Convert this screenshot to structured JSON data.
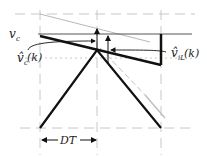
{
  "diagram": {
    "labels": {
      "vc": "v",
      "vc_sub": "c",
      "vc_hat": "v̂",
      "vc_hat_sub": "c",
      "vc_hat_arg": "(k)",
      "vil_hat": "v̂",
      "vil_hat_sub": "iL",
      "vil_hat_arg": "(k)",
      "dt": "DT"
    },
    "colors": {
      "line": "#111111",
      "guide": "#c8c8c8",
      "ghost": "#b0b0b0"
    }
  }
}
